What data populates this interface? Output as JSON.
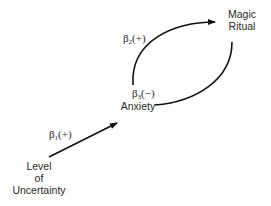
{
  "nodes": {
    "uncertainty": {
      "line1": "Level",
      "line2": "of",
      "line3": "Uncertainty"
    },
    "anxiety": {
      "label": "Anxiety"
    },
    "ritual": {
      "line1": "Magic",
      "line2": "Ritual"
    }
  },
  "edges": {
    "b1": {
      "beta": "β",
      "sub": "1",
      "sign": "(+)",
      "from": "Level of Uncertainty",
      "to": "Anxiety"
    },
    "b2": {
      "beta": "β",
      "sub": "2",
      "sign": "(+)",
      "from": "Anxiety",
      "to": "Magic Ritual"
    },
    "b3": {
      "beta": "β",
      "sub": "3",
      "sign": "(−)",
      "from": "Magic Ritual",
      "to": "Anxiety"
    }
  },
  "colors": {
    "line": "#111111",
    "text": "#2a2a2a"
  }
}
